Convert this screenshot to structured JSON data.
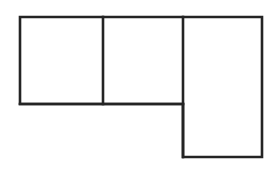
{
  "figure": {
    "canvas": {
      "width": 278,
      "height": 170,
      "background": "#ffffff"
    },
    "style": {
      "stroke_color": "#242424",
      "stroke_width": 2.6,
      "fill_color": "#ffffff",
      "line_cap": "square",
      "line_join": "miter"
    },
    "outline": {
      "name": "l-shape-outline",
      "points": "20,17 262,17 262,157 183,157 183,104 20,104",
      "closed": true
    },
    "cells": [
      {
        "name": "left-square",
        "label": "",
        "x": 20,
        "y": 17,
        "width": 83,
        "height": 87
      },
      {
        "name": "middle-square",
        "label": "",
        "x": 103,
        "y": 17,
        "width": 80,
        "height": 87
      },
      {
        "name": "right-tall-rectangle",
        "label": "",
        "x": 183,
        "y": 17,
        "width": 79,
        "height": 140
      }
    ],
    "dividers": [
      {
        "name": "divider-vertical-first",
        "orientation": "vertical",
        "x1": 103,
        "y1": 17,
        "x2": 103,
        "y2": 104
      },
      {
        "name": "divider-vertical-second",
        "orientation": "vertical",
        "x1": 183,
        "y1": 17,
        "x2": 183,
        "y2": 157
      },
      {
        "name": "divider-horizontal-lower",
        "orientation": "horizontal",
        "x1": 20,
        "y1": 104,
        "x2": 183,
        "y2": 104
      }
    ]
  },
  "chart_data": {
    "type": "diagram",
    "xlabel": "",
    "ylabel": "",
    "shapes": [
      {
        "name": "left-square",
        "type": "rectangle",
        "x": 20,
        "y": 17,
        "width": 83,
        "height": 87
      },
      {
        "name": "middle-square",
        "type": "rectangle",
        "x": 103,
        "y": 17,
        "width": 80,
        "height": 87
      },
      {
        "name": "right-tall-rectangle",
        "type": "rectangle",
        "x": 183,
        "y": 17,
        "width": 79,
        "height": 140
      }
    ],
    "annotations": []
  }
}
